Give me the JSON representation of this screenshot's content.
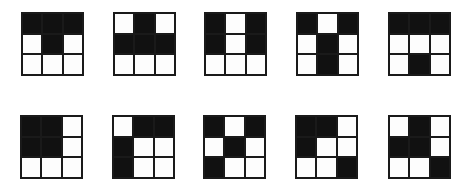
{
  "figure": {
    "colors": {
      "filled": "#111111",
      "empty": "#fdfdfd",
      "border": "#1a1a1a"
    },
    "rows": [
      {
        "grids": [
          {
            "id": "r1g1",
            "cells": [
              [
                1,
                1,
                1
              ],
              [
                0,
                1,
                0
              ],
              [
                0,
                0,
                0
              ]
            ]
          },
          {
            "id": "r1g2",
            "cells": [
              [
                0,
                1,
                0
              ],
              [
                1,
                1,
                1
              ],
              [
                0,
                0,
                0
              ]
            ]
          },
          {
            "id": "r1g3",
            "cells": [
              [
                1,
                0,
                1
              ],
              [
                1,
                0,
                1
              ],
              [
                0,
                0,
                0
              ]
            ]
          },
          {
            "id": "r1g4",
            "cells": [
              [
                1,
                0,
                1
              ],
              [
                0,
                1,
                0
              ],
              [
                0,
                1,
                0
              ]
            ]
          },
          {
            "id": "r1g5",
            "cells": [
              [
                1,
                1,
                1
              ],
              [
                0,
                0,
                0
              ],
              [
                0,
                1,
                0
              ]
            ]
          }
        ]
      },
      {
        "grids": [
          {
            "id": "r2g1",
            "cells": [
              [
                1,
                1,
                0
              ],
              [
                1,
                1,
                0
              ],
              [
                0,
                0,
                0
              ]
            ]
          },
          {
            "id": "r2g2",
            "cells": [
              [
                0,
                1,
                1
              ],
              [
                1,
                0,
                0
              ],
              [
                1,
                0,
                0
              ]
            ]
          },
          {
            "id": "r2g3",
            "cells": [
              [
                1,
                0,
                1
              ],
              [
                0,
                1,
                0
              ],
              [
                1,
                0,
                0
              ]
            ]
          },
          {
            "id": "r2g4",
            "cells": [
              [
                1,
                1,
                0
              ],
              [
                1,
                0,
                0
              ],
              [
                0,
                0,
                1
              ]
            ]
          },
          {
            "id": "r2g5",
            "cells": [
              [
                0,
                1,
                0
              ],
              [
                1,
                1,
                0
              ],
              [
                0,
                0,
                1
              ]
            ]
          }
        ]
      }
    ]
  }
}
